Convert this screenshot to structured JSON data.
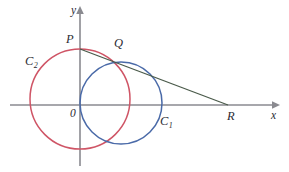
{
  "figure": {
    "background_color": "#ffffff",
    "width": 289,
    "height": 172
  },
  "axes": {
    "x_axis": {
      "label": "x",
      "color": "#8a8a90",
      "y_pixel": 105,
      "x_start": 10,
      "x_end": 278,
      "arrow": "right"
    },
    "y_axis": {
      "label": "y",
      "color": "#8a8a90",
      "x_pixel": 80,
      "y_start": 8,
      "y_end": 166,
      "arrow": "up"
    },
    "origin_label": "0"
  },
  "points": [
    {
      "name": "P",
      "label": "P",
      "x": 80,
      "y": 49,
      "label_x": 66,
      "label_y": 33
    },
    {
      "name": "Q",
      "label": "Q",
      "x": 113,
      "y": 62,
      "label_x": 114,
      "label_y": 37
    },
    {
      "name": "R",
      "label": "R",
      "x": 228,
      "y": 105,
      "label_x": 227,
      "label_y": 110
    },
    {
      "name": "O",
      "label": "0",
      "x": 80,
      "y": 105,
      "label_x": 70,
      "label_y": 108
    }
  ],
  "circles": [
    {
      "name": "C1",
      "label": "C",
      "subscript": "1",
      "color": "#4a6aa8",
      "cx": 121,
      "cy": 103,
      "r": 41,
      "label_x": 160,
      "label_y": 115
    },
    {
      "name": "C2",
      "label": "C",
      "subscript": "2",
      "color": "#cf5566",
      "cx": 80,
      "cy": 99,
      "r": 50,
      "label_x": 25,
      "label_y": 55
    }
  ],
  "line": {
    "name": "secant-PQR",
    "color": "#4a5a4a",
    "x1": 80,
    "y1": 49,
    "x2": 228,
    "y2": 105
  },
  "colors": {
    "red_circle": "#cf5566",
    "blue_circle": "#4a6aa8",
    "axis_gray": "#8a8a90",
    "line_dark": "#4a5a4a",
    "label_text": "#2b2b33",
    "background": "#ffffff"
  }
}
